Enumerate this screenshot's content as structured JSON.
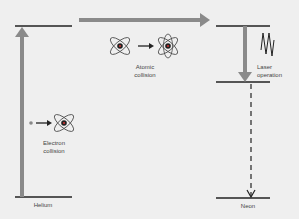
{
  "diagram": {
    "type": "energy-level-diagram",
    "colors": {
      "background": "#efefef",
      "level_line": "#222222",
      "gray_arrow": "#8a8a8a",
      "dashed_arrow": "#222222",
      "text": "#444444"
    },
    "labels": {
      "helium": "Helium",
      "neon": "Neon",
      "electron_collision_line1": "Electron",
      "electron_collision_line2": "collision",
      "atomic_collision_line1": "Atomic",
      "atomic_collision_line2": "collision",
      "laser_operation_line1": "Laser",
      "laser_operation_line2": "operation"
    },
    "icons": {
      "atom": "atom-icon",
      "electron": "electron-dot-icon",
      "photon_wave": "wave-icon"
    }
  }
}
